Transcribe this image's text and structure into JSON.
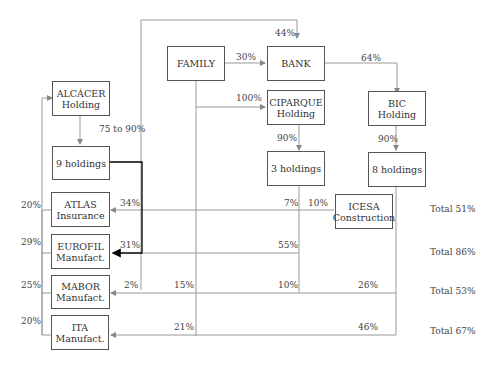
{
  "nodes": {
    "family": "FAMILY",
    "bank": "BANK",
    "alcacer": {
      "line1": "ALCÁCER",
      "line2": "Holding"
    },
    "ciparque": {
      "line1": "CIPARQUE",
      "line2": "Holding"
    },
    "bic": {
      "line1": "BIC",
      "line2": "Holding"
    },
    "nine_holdings": "9 holdings",
    "three_holdings": "3 holdings",
    "eight_holdings": "8 holdings",
    "atlas": {
      "line1": "ATLAS",
      "line2": "Insurance"
    },
    "eurofil": {
      "line1": "EUROFIL",
      "line2": "Manufact."
    },
    "mabor": {
      "line1": "MABOR",
      "line2": "Manufact."
    },
    "ita": {
      "line1": "ITA",
      "line2": "Manufact."
    },
    "icesa": {
      "line1": "ICESA",
      "line2": "Construction"
    }
  },
  "edges": {
    "family_bank": "30%",
    "top_bank": "44%",
    "bank_bic": "64%",
    "family_ciparque": "100%",
    "alcacer_nine": "75 to 90%",
    "ciparque_three": "90%",
    "bic_eight": "90%",
    "atlas_from_nine": "34%",
    "atlas_from_three": "7%",
    "atlas_from_icesa": "10%",
    "eurofil_from_nine": "31%",
    "eurofil_from_three": "55%",
    "mabor_2": "2%",
    "mabor_family": "15%",
    "mabor_three": "10%",
    "mabor_eight": "26%",
    "ita_family": "21%",
    "ita_eight": "46%",
    "left_atlas": "20%",
    "left_eurofil": "29%",
    "left_mabor": "25%",
    "left_ita": "20%"
  },
  "totals": {
    "atlas": "Total 51%",
    "eurofil": "Total 86%",
    "mabor": "Total 53%",
    "ita": "Total 67%"
  }
}
